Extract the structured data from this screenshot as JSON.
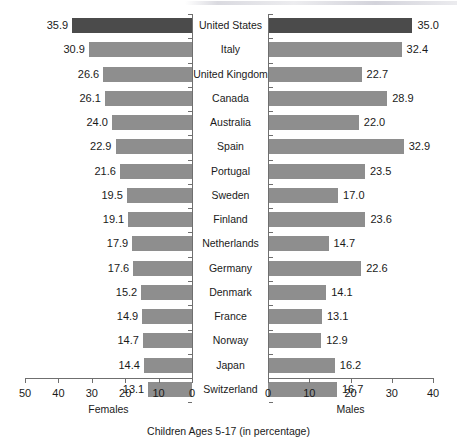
{
  "chart_data": {
    "type": "bar",
    "subtype": "diverging-population-pyramid",
    "title": "",
    "caption": "Children Ages 5-17 (in percentage)",
    "categories": [
      "United States",
      "Italy",
      "United Kingdom",
      "Canada",
      "Australia",
      "Spain",
      "Portugal",
      "Sweden",
      "Finland",
      "Netherlands",
      "Germany",
      "Denmark",
      "France",
      "Norway",
      "Japan",
      "Switzerland"
    ],
    "series": [
      {
        "name": "Females",
        "side": "left",
        "axis_label": "Females",
        "ticks": [
          50,
          40,
          30,
          20,
          10,
          0
        ],
        "tick_labels": [
          "50",
          "40",
          "30",
          "20",
          "10",
          "0"
        ],
        "axis_min": 0,
        "axis_max": 50,
        "values": [
          35.9,
          30.9,
          26.6,
          26.1,
          24.0,
          22.9,
          21.6,
          19.5,
          19.1,
          17.9,
          17.6,
          15.2,
          14.9,
          14.7,
          14.4,
          13.1
        ],
        "value_labels": [
          "35.9",
          "30.9",
          "26.6",
          "26.1",
          "24.0",
          "22.9",
          "21.6",
          "19.5",
          "19.1",
          "17.9",
          "17.6",
          "15.2",
          "14.9",
          "14.7",
          "14.4",
          "13.1"
        ]
      },
      {
        "name": "Males",
        "side": "right",
        "axis_label": "Males",
        "ticks": [
          0,
          10,
          20,
          30,
          40
        ],
        "tick_labels": [
          "0",
          "10",
          "20",
          "30",
          "40"
        ],
        "axis_min": 0,
        "axis_max": 40,
        "values": [
          35.0,
          32.4,
          22.7,
          28.9,
          22.0,
          32.9,
          23.5,
          17.0,
          23.6,
          14.7,
          22.6,
          14.1,
          13.1,
          12.9,
          16.2,
          16.7
        ],
        "value_labels": [
          "35.0",
          "32.4",
          "22.7",
          "28.9",
          "22.0",
          "32.9",
          "23.5",
          "17.0",
          "23.6",
          "14.7",
          "22.6",
          "14.1",
          "13.1",
          "12.9",
          "16.2",
          "16.7"
        ]
      }
    ],
    "highlight_category": "United States",
    "colors": {
      "bar": "#8e8e8e",
      "bar_highlight": "#4b4b4b",
      "axis": "#6f6f6f",
      "text": "#1a1a1a",
      "background": "#ffffff"
    },
    "grid": false,
    "legend": "none",
    "xlabel": "",
    "ylabel": ""
  }
}
